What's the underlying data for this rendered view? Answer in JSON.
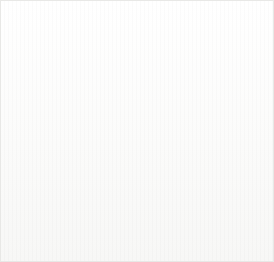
{
  "figure": {
    "kind": "anatomical-illustration",
    "width": 274,
    "height": 262,
    "background_color": "#fdfdfd",
    "ink_color": "#3b3b3b",
    "arrow_color": "#8a8a8a",
    "label_color": "#1d1d1d",
    "shadow_color": "#b9b9b9"
  },
  "labels": [
    {
      "id": "neck",
      "text": "Neck",
      "x": 23,
      "y": 203
    },
    {
      "id": "backbone",
      "text": "Backbone",
      "x": 75,
      "y": 225
    },
    {
      "id": "hip_joint",
      "text": "Hip joint",
      "x": 154,
      "y": 212
    },
    {
      "id": "tail",
      "text": "Tail",
      "x": 223,
      "y": 184
    }
  ],
  "arrows": [
    {
      "id": "neck-arrow",
      "points_to": "Neck",
      "x1": 42,
      "y1": 196,
      "x2": 42,
      "y2": 129,
      "direction": "up"
    },
    {
      "id": "backbone-arrow",
      "points_to": "Backbone",
      "x1": 98,
      "y1": 219,
      "x2": 107,
      "y2": 104,
      "direction": "up"
    },
    {
      "id": "hip-joint-arrow",
      "points_to": "Hip joint",
      "x1": 177,
      "y1": 206,
      "x2": 187,
      "y2": 133,
      "direction": "up"
    },
    {
      "id": "tail-arrow",
      "points_to": "Tail",
      "x1": 235,
      "y1": 178,
      "x2": 235,
      "y2": 122,
      "direction": "up"
    }
  ]
}
